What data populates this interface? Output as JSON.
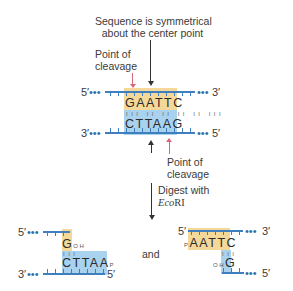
{
  "annotations": {
    "symmetry_label_line1": "Sequence is symmetrical",
    "symmetry_label_line2": "about the center point",
    "cleavage_top_line1": "Point of",
    "cleavage_top_line2": "cleavage",
    "cleavage_bottom_line1": "Point of",
    "cleavage_bottom_line2": "cleavage",
    "digest_line1": "Digest with",
    "enzyme_italic": "Eco",
    "enzyme_roman": "RI",
    "and_label": "and"
  },
  "intact_dna": {
    "top_5prime": "5′",
    "top_3prime": "3′",
    "bottom_3prime": "3′",
    "bottom_5prime": "5′",
    "dots": "•••",
    "top_sequence": "GAATTC",
    "bottom_sequence": "CTTAAG",
    "hbonds": "III II II II II III"
  },
  "fragment_left": {
    "top_5prime": "5′",
    "bottom_3prime": "3′",
    "bottom_5prime": "5′",
    "dots": "•••",
    "top_base": "G",
    "top_base_end": "OH",
    "bottom_sequence": "CTTAA",
    "bottom_end": "P",
    "hbond": "III"
  },
  "fragment_right": {
    "top_5prime": "5′",
    "top_3prime": "3′",
    "bottom_5prime": "5′",
    "dots": "•••",
    "top_start": "P",
    "top_sequence": "AATTC",
    "bottom_base_start": "OH",
    "bottom_base": "G",
    "hbond": "III"
  },
  "colors": {
    "strand_blue": "#3f7fbf",
    "top_highlight": "#f4d89a",
    "bottom_highlight": "#a9d2ef",
    "cleavage_arrow": "#d9667a",
    "symmetry_arrow": "#333333"
  }
}
